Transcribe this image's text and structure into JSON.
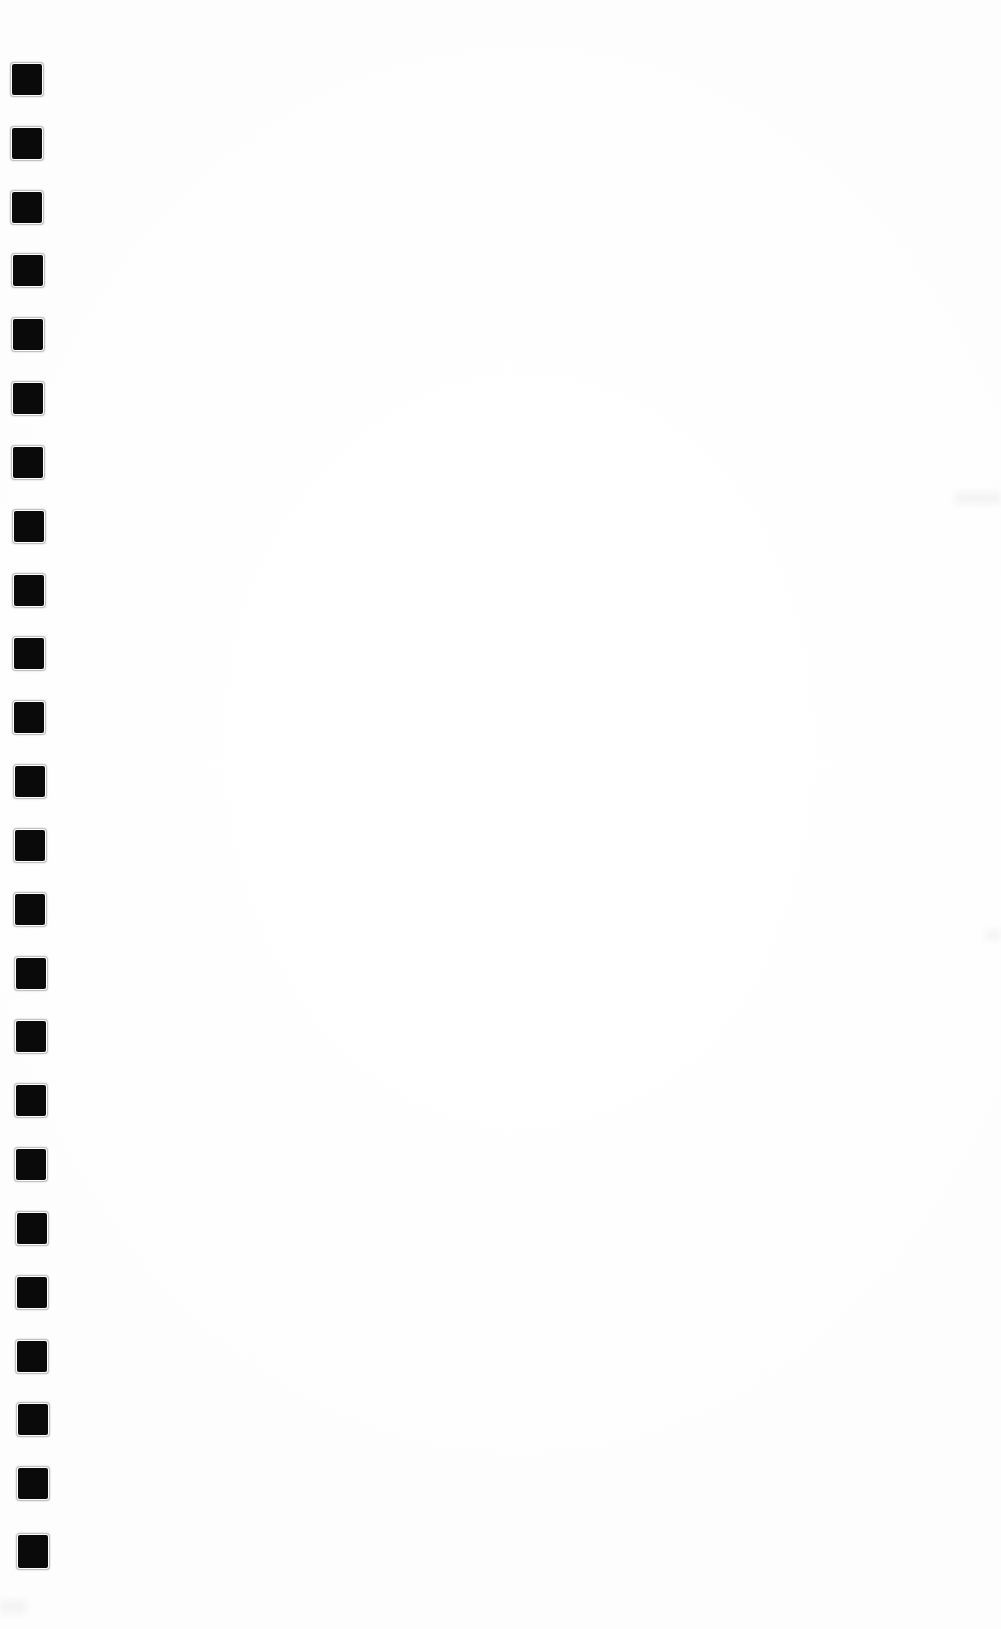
{
  "page": {
    "width": 1001,
    "height": 1629,
    "background_color": "#ffffff",
    "content_text": ""
  },
  "marks": {
    "label": "registration-mark-column",
    "count": 24,
    "color": "#0a0a0a",
    "shape": "rounded-square",
    "corner_radius_px": 2,
    "width_px": 30,
    "height_px": 31,
    "vertical_pitch_px": 63.96,
    "first_top_px": 64,
    "last_top_px": 1535,
    "horizontal_drift_px": 6,
    "items": [
      {
        "index": 1,
        "x": 12,
        "y": 64,
        "w": 30,
        "h": 31
      },
      {
        "index": 2,
        "x": 12,
        "y": 128,
        "w": 30,
        "h": 31
      },
      {
        "index": 3,
        "x": 12,
        "y": 192,
        "w": 30,
        "h": 31
      },
      {
        "index": 4,
        "x": 13,
        "y": 255,
        "w": 30,
        "h": 31
      },
      {
        "index": 5,
        "x": 13,
        "y": 319,
        "w": 30,
        "h": 31
      },
      {
        "index": 6,
        "x": 13,
        "y": 383,
        "w": 30,
        "h": 31
      },
      {
        "index": 7,
        "x": 13,
        "y": 447,
        "w": 30,
        "h": 31
      },
      {
        "index": 8,
        "x": 14,
        "y": 511,
        "w": 30,
        "h": 31
      },
      {
        "index": 9,
        "x": 14,
        "y": 575,
        "w": 30,
        "h": 31
      },
      {
        "index": 10,
        "x": 14,
        "y": 638,
        "w": 30,
        "h": 31
      },
      {
        "index": 11,
        "x": 14,
        "y": 702,
        "w": 30,
        "h": 31
      },
      {
        "index": 12,
        "x": 15,
        "y": 766,
        "w": 30,
        "h": 31
      },
      {
        "index": 13,
        "x": 15,
        "y": 830,
        "w": 30,
        "h": 31
      },
      {
        "index": 14,
        "x": 15,
        "y": 894,
        "w": 30,
        "h": 31
      },
      {
        "index": 15,
        "x": 16,
        "y": 958,
        "w": 30,
        "h": 31
      },
      {
        "index": 16,
        "x": 16,
        "y": 1021,
        "w": 30,
        "h": 31
      },
      {
        "index": 17,
        "x": 16,
        "y": 1085,
        "w": 30,
        "h": 31
      },
      {
        "index": 18,
        "x": 16,
        "y": 1149,
        "w": 30,
        "h": 31
      },
      {
        "index": 19,
        "x": 17,
        "y": 1213,
        "w": 30,
        "h": 31
      },
      {
        "index": 20,
        "x": 17,
        "y": 1277,
        "w": 30,
        "h": 31
      },
      {
        "index": 21,
        "x": 17,
        "y": 1341,
        "w": 30,
        "h": 31
      },
      {
        "index": 22,
        "x": 18,
        "y": 1404,
        "w": 30,
        "h": 31
      },
      {
        "index": 23,
        "x": 18,
        "y": 1468,
        "w": 30,
        "h": 31
      },
      {
        "index": 24,
        "x": 18,
        "y": 1535,
        "w": 30,
        "h": 33
      }
    ]
  },
  "artifacts": {
    "label": "scan-artifacts",
    "color": "#f4f4f4",
    "items": [
      {
        "x": 955,
        "y": 492,
        "w": 46,
        "h": 12
      },
      {
        "x": 986,
        "y": 930,
        "w": 15,
        "h": 10
      },
      {
        "x": 0,
        "y": 1600,
        "w": 26,
        "h": 14
      }
    ]
  }
}
